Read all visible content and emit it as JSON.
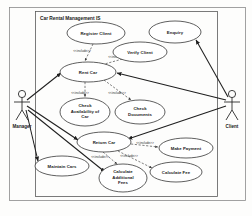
{
  "diagram": {
    "kind": "uml-use-case-diagram",
    "system_title": "Car Rental Management IS",
    "canvas": {
      "width": 252,
      "height": 216
    },
    "colors": {
      "background": "#fdfdfc",
      "ellipse_fill": "#ffffff",
      "ellipse_stroke": "#2b2b2b",
      "association": "#1f1f1f",
      "include": "#3a3a3a",
      "frame_outer": "#8a8a8a",
      "frame_inner": "#5a5a5a",
      "text": "#1a1a1a"
    },
    "stereotype": "<<include>>",
    "actors": [
      {
        "id": "manager",
        "label": "Manager",
        "x": 22,
        "y": 103
      },
      {
        "id": "client",
        "label": "Client",
        "x": 232,
        "y": 103
      }
    ],
    "use_cases": [
      {
        "id": "register_client",
        "label": "Register Client",
        "cx": 96,
        "cy": 33,
        "rx": 29,
        "ry": 11
      },
      {
        "id": "verify_client",
        "label": "Verify Client",
        "cx": 140,
        "cy": 52,
        "rx": 27,
        "ry": 10
      },
      {
        "id": "enquiry",
        "label": "Enquiry",
        "cx": 175,
        "cy": 32,
        "rx": 26,
        "ry": 11
      },
      {
        "id": "rent_car",
        "label": "Rent Car",
        "cx": 88,
        "cy": 72,
        "rx": 28,
        "ry": 10
      },
      {
        "id": "check_avail",
        "label": "Check Availability of Car",
        "cx": 85,
        "cy": 112,
        "rx": 25,
        "ry": 14
      },
      {
        "id": "check_documents",
        "label": "Check Documents",
        "cx": 140,
        "cy": 112,
        "rx": 25,
        "ry": 12
      },
      {
        "id": "return_car",
        "label": "Return Car",
        "cx": 104,
        "cy": 142,
        "rx": 27,
        "ry": 10
      },
      {
        "id": "make_payment",
        "label": "Make Payment",
        "cx": 186,
        "cy": 148,
        "rx": 27,
        "ry": 10
      },
      {
        "id": "maintain_cars",
        "label": "Maintain Cars",
        "cx": 62,
        "cy": 166,
        "rx": 27,
        "ry": 10
      },
      {
        "id": "calculate_fee",
        "label": "Calculate Fee",
        "cx": 176,
        "cy": 172,
        "rx": 26,
        "ry": 10
      },
      {
        "id": "calc_add_fees",
        "label": "Calculate Additional Fees",
        "cx": 123,
        "cy": 178,
        "rx": 24,
        "ry": 14
      }
    ],
    "use_case_text_lines": {
      "register_client": [
        "Register Client"
      ],
      "verify_client": [
        "Verify Client"
      ],
      "enquiry": [
        "Enquiry"
      ],
      "rent_car": [
        "Rent Car"
      ],
      "check_avail": [
        "Check",
        "Availability of",
        "Car"
      ],
      "check_documents": [
        "Check",
        "Documents"
      ],
      "return_car": [
        "Return Car"
      ],
      "make_payment": [
        "Make Payment"
      ],
      "maintain_cars": [
        "Maintain Cars"
      ],
      "calculate_fee": [
        "Calculate Fee"
      ],
      "calc_add_fees": [
        "Calculate",
        "Additional",
        "Fees"
      ]
    },
    "associations": [
      {
        "from": "manager",
        "to": "rent_car"
      },
      {
        "from": "manager",
        "to": "return_car"
      },
      {
        "from": "manager",
        "to": "maintain_cars"
      },
      {
        "from": "manager",
        "to": "calc_add_fees"
      },
      {
        "from": "client",
        "to": "enquiry"
      },
      {
        "from": "client",
        "to": "rent_car"
      },
      {
        "from": "client",
        "to": "return_car"
      }
    ],
    "includes": [
      {
        "from": "register_client",
        "to": "rent_car",
        "label": "<<include>>"
      },
      {
        "from": "verify_client",
        "to": "rent_car",
        "label": "<<include>>"
      },
      {
        "from": "rent_car",
        "to": "check_avail",
        "label": "<<include>>"
      },
      {
        "from": "rent_car",
        "to": "check_documents",
        "label": "<<include>>"
      },
      {
        "from": "return_car",
        "to": "make_payment",
        "label": "<<include>>"
      },
      {
        "from": "return_car",
        "to": "calc_add_fees",
        "label": "<<include>>"
      },
      {
        "from": "return_car",
        "to": "calculate_fee",
        "label": "<<include>>"
      }
    ]
  }
}
